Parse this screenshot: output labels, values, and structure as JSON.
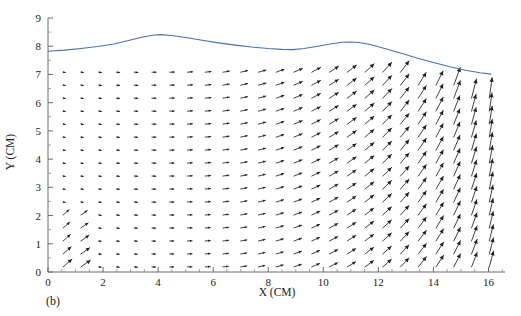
{
  "figure": {
    "caption": "(b)",
    "caption_name": "panel-label"
  },
  "chart_data": {
    "type": "scatter",
    "subtype": "quiver-vector-field",
    "title": "",
    "xlabel": "X (CM)",
    "ylabel": "Y (CM)",
    "xlim": [
      0,
      16.6
    ],
    "ylim": [
      0,
      9
    ],
    "xticks": [
      0,
      2,
      4,
      6,
      8,
      10,
      12,
      14,
      16
    ],
    "xticklabels": [
      "0",
      "2",
      "4",
      "6",
      "8",
      "10",
      "12",
      "14",
      "16"
    ],
    "xtick_minor_step": 0.5,
    "yticks": [
      0,
      1,
      2,
      3,
      4,
      5,
      6,
      7,
      8,
      9
    ],
    "yticklabels": [
      "0",
      "1",
      "2",
      "3",
      "4",
      "5",
      "6",
      "7",
      "8",
      "9"
    ],
    "ytick_minor_step": 0.5,
    "grid": false,
    "legend": "none",
    "arrow_color": "#1f1f1f",
    "axis_color": "#6b6b6b",
    "series": [
      {
        "name": "free-surface",
        "type": "line",
        "color": "#4a6fb5",
        "x": [
          0.0,
          0.6,
          1.2,
          1.8,
          2.4,
          3.0,
          3.4,
          3.8,
          4.1,
          4.5,
          5.0,
          5.6,
          6.2,
          6.8,
          7.4,
          8.0,
          8.5,
          8.9,
          9.3,
          9.8,
          10.3,
          10.7,
          11.0,
          11.3,
          11.7,
          12.2,
          12.8,
          13.4,
          14.0,
          14.6,
          15.2,
          15.7,
          16.1
        ],
        "y": [
          7.82,
          7.86,
          7.92,
          7.99,
          8.08,
          8.22,
          8.32,
          8.39,
          8.41,
          8.38,
          8.31,
          8.21,
          8.12,
          8.04,
          7.97,
          7.92,
          7.89,
          7.88,
          7.92,
          8.0,
          8.09,
          8.14,
          8.15,
          8.13,
          8.06,
          7.93,
          7.76,
          7.58,
          7.42,
          7.27,
          7.14,
          7.06,
          7.01
        ]
      },
      {
        "name": "velocity-vectors",
        "type": "quiver",
        "grid_columns": 25,
        "grid_rows": 16,
        "x_start": 0.55,
        "x_step": 0.645,
        "y_start": 0.18,
        "y_step": 0.46,
        "description": "Velocity vector field; arrows small and near-horizontal (slightly downward-right) on the left, growing larger and rotating upward-right toward the right side of the domain; strongest, steepest vectors in the upper-right region near x=15-16."
      }
    ],
    "notes": {
      "surface_start_y": 7.82,
      "surface_peak_y": 8.41,
      "surface_peak_x": 4.1,
      "surface_local_min_y": 7.88,
      "surface_local_min_x": 8.9,
      "surface_second_peak_y": 8.15,
      "surface_second_peak_x": 11.0,
      "surface_end_y": 7.01
    }
  }
}
